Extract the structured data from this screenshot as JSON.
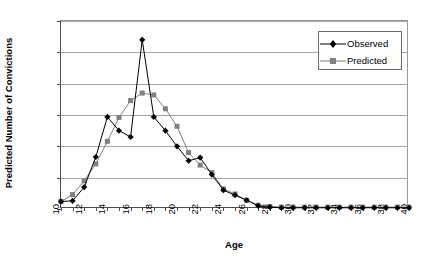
{
  "chart_data": {
    "type": "line",
    "title": "",
    "xlabel": "Age",
    "ylabel": "Predicted Number of Convictions",
    "xlim": [
      10,
      40
    ],
    "ylim": [
      0,
      0.3
    ],
    "grid": true,
    "legend_position": "upper right",
    "y_ticks": [
      "0",
      "0.05",
      "0.1",
      "0.15",
      "0.2",
      "0.25",
      "0.3"
    ],
    "y_tick_values": [
      0,
      0.05,
      0.1,
      0.15,
      0.2,
      0.25,
      0.3
    ],
    "x_ticks": [
      "10",
      "12",
      "14",
      "16",
      "18",
      "20",
      "22",
      "24",
      "26",
      "28",
      "30",
      "32",
      "34",
      "36",
      "38",
      "40"
    ],
    "x_tick_values": [
      10,
      12,
      14,
      16,
      18,
      20,
      22,
      24,
      26,
      28,
      30,
      32,
      34,
      36,
      38,
      40
    ],
    "x": [
      10,
      11,
      12,
      13,
      14,
      15,
      16,
      17,
      18,
      19,
      20,
      21,
      22,
      23,
      24,
      25,
      26,
      27,
      28,
      29,
      30,
      31,
      32,
      33,
      34,
      35,
      36,
      37,
      38,
      39,
      40
    ],
    "series": [
      {
        "name": "Observed",
        "marker": "diamond",
        "color": "#000000",
        "values": [
          0.012,
          0.013,
          0.035,
          0.083,
          0.147,
          0.125,
          0.115,
          0.27,
          0.147,
          0.125,
          0.1,
          0.077,
          0.082,
          0.055,
          0.03,
          0.022,
          0.014,
          0.005,
          0.003,
          0.002,
          0.002,
          0.002,
          0.002,
          0.002,
          0.002,
          0.002,
          0.002,
          0.002,
          0.002,
          0.002,
          0.002
        ]
      },
      {
        "name": "Predicted",
        "marker": "square",
        "color": "#808080",
        "values": [
          0.012,
          0.023,
          0.045,
          0.072,
          0.108,
          0.146,
          0.173,
          0.185,
          0.182,
          0.16,
          0.132,
          0.09,
          0.07,
          0.058,
          0.032,
          0.024,
          0.014,
          0.006,
          0.004,
          0.003,
          0.003,
          0.003,
          0.003,
          0.003,
          0.003,
          0.003,
          0.003,
          0.003,
          0.003,
          0.003,
          0.003
        ]
      }
    ]
  },
  "legend": {
    "items": [
      {
        "label": "Observed"
      },
      {
        "label": "Predicted"
      }
    ]
  }
}
